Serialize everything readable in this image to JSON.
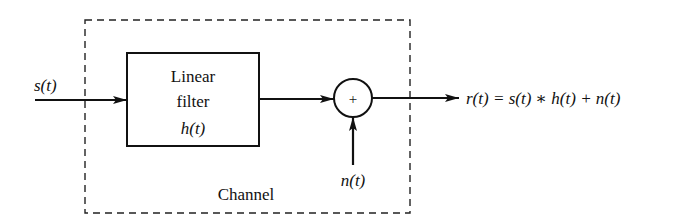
{
  "diagram": {
    "type": "block-diagram",
    "input_signal": "s(t)",
    "filter_block": {
      "line1": "Linear",
      "line2": "filter",
      "line3": "h(t)"
    },
    "summing_junction": {
      "symbol": "+"
    },
    "noise_signal": "n(t)",
    "output_equation": "r(t) = s(t) ∗ h(t) + n(t)",
    "channel_label": "Channel"
  }
}
